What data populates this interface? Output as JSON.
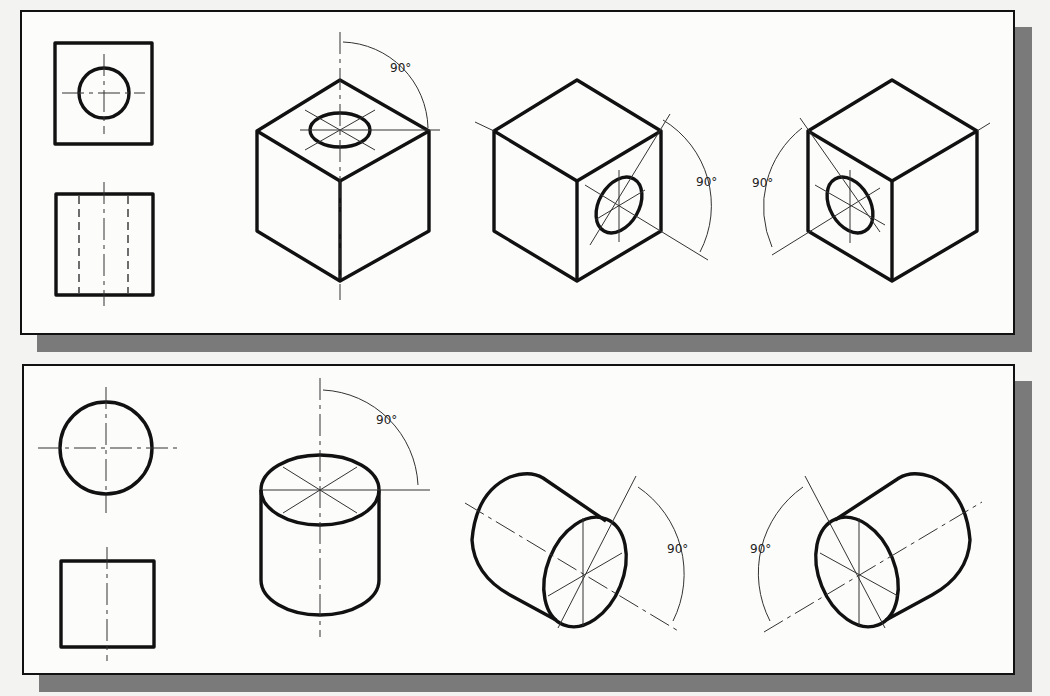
{
  "figure": {
    "panels": [
      {
        "id": "cube-panel",
        "orthographic_views": [
          "top-view-square-with-hole",
          "front-view-square-with-hidden-lines"
        ],
        "isometric_views": [
          {
            "orientation": "hole-on-top-face",
            "angle_label": "90°"
          },
          {
            "orientation": "hole-on-right-face",
            "angle_label": "90°"
          },
          {
            "orientation": "hole-on-left-face",
            "angle_label": "90°"
          }
        ]
      },
      {
        "id": "cylinder-panel",
        "orthographic_views": [
          "top-view-circle",
          "front-view-square"
        ],
        "isometric_views": [
          {
            "orientation": "cylinder-axis-vertical",
            "angle_label": "90°"
          },
          {
            "orientation": "cylinder-axis-right",
            "angle_label": "90°"
          },
          {
            "orientation": "cylinder-axis-left",
            "angle_label": "90°"
          }
        ]
      }
    ],
    "colors": {
      "line": "#111111",
      "background": "#fcfcfb",
      "shadow": "#7a7a7a"
    }
  }
}
